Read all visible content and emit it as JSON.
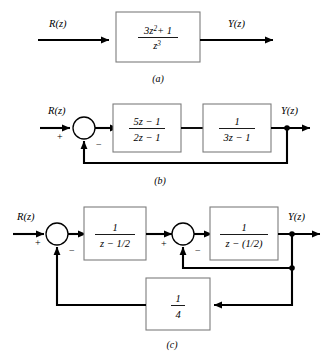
{
  "figure": {
    "captions": {
      "a": "(a)",
      "b": "(b)",
      "c": "(c)"
    },
    "signals": {
      "input": "R(z)",
      "output": "Y(z)"
    },
    "signs": {
      "plus": "+",
      "minus": "−"
    }
  },
  "diagram_a": {
    "caption": "(a)",
    "input_label": "R(z)",
    "output_label": "Y(z)",
    "block": {
      "name": "forward-block",
      "numerator": "3z",
      "numerator_exp": "2",
      "numerator_tail": "+ 1",
      "denominator": "z",
      "denominator_exp": "3",
      "expression": "(3z^2 + 1)/z^3"
    }
  },
  "diagram_b": {
    "caption": "(b)",
    "input_label": "R(z)",
    "output_label": "Y(z)",
    "summing_junction": {
      "input_sign": "+",
      "feedback_sign": "−"
    },
    "block1": {
      "numerator": "5z − 1",
      "denominator": "2z − 1",
      "expression": "(5z-1)/(2z-1)"
    },
    "block2": {
      "numerator": "1",
      "denominator": "3z − 1",
      "expression": "1/(3z-1)"
    },
    "feedback": {
      "gain": "1",
      "description": "unity feedback"
    }
  },
  "diagram_c": {
    "caption": "(c)",
    "input_label": "R(z)",
    "output_label": "Y(z)",
    "summing_junction_1": {
      "input_sign": "+",
      "feedback_sign": "−"
    },
    "summing_junction_2": {
      "input_sign": "+",
      "feedback_sign": "−"
    },
    "block1": {
      "numerator": "1",
      "denominator": "z − 1/2",
      "expression": "1/(z-1/2)"
    },
    "block2": {
      "numerator": "1",
      "denominator": "z − (1/2)",
      "expression": "1/(z-(1/2))"
    },
    "feedback_block": {
      "numerator": "1",
      "denominator": "4",
      "expression": "1/4"
    }
  },
  "colors": {
    "wire": "#000000",
    "block_border": "#7d7d7d",
    "background": "#ffffff"
  }
}
